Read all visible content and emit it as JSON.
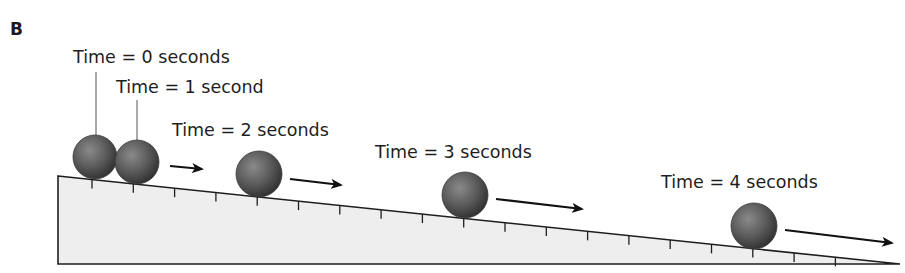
{
  "figure": {
    "panel_label": "B",
    "colors": {
      "ramp_fill": "#eeeeee",
      "ramp_stroke": "#1e1e1e",
      "ball_light": "#8a8a8a",
      "ball_mid": "#5a5a5a",
      "ball_dark": "#2e2e2e",
      "arrow": "#111111",
      "leader_line": "#555555"
    },
    "ramp": {
      "top_left": [
        58,
        176
      ],
      "bottom_left": [
        58,
        264
      ],
      "bottom_right": [
        900,
        264
      ],
      "tick_count": 20,
      "tick_start_x": 92,
      "tick_spacing": 41.3,
      "tick_length": 9
    },
    "balls": [
      {
        "label": "Time = 0 seconds",
        "cx": 95,
        "cy": 157,
        "r": 22,
        "label_x": 73,
        "label_y": 63,
        "leader": [
          96,
          72,
          96,
          135
        ],
        "arrow": null
      },
      {
        "label": "Time = 1 second",
        "cx": 137,
        "cy": 162,
        "r": 22,
        "label_x": 116,
        "label_y": 93,
        "leader": [
          137,
          100,
          137,
          140
        ],
        "arrow": [
          170,
          166,
          202,
          169
        ]
      },
      {
        "label": "Time = 2 seconds",
        "cx": 259,
        "cy": 174,
        "r": 23,
        "label_x": 172,
        "label_y": 136,
        "leader": null,
        "arrow": [
          290,
          179,
          341,
          185
        ]
      },
      {
        "label": "Time = 3 seconds",
        "cx": 465,
        "cy": 195,
        "r": 23,
        "label_x": 375,
        "label_y": 158,
        "leader": null,
        "arrow": [
          496,
          199,
          582,
          209
        ]
      },
      {
        "label": "Time = 4 seconds",
        "cx": 754,
        "cy": 226,
        "r": 23,
        "label_x": 661,
        "label_y": 188,
        "leader": null,
        "arrow": [
          785,
          230,
          892,
          243
        ]
      }
    ]
  }
}
